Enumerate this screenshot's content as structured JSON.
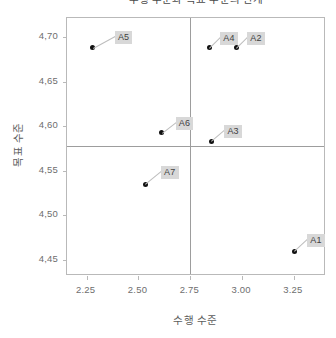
{
  "chart_data": {
    "type": "scatter",
    "title": "수행 수준과 목표 수준의 관계",
    "xlabel": "수행 수준",
    "ylabel": "목표 수준",
    "xlim": [
      2.155,
      3.405
    ],
    "ylim": [
      4.432,
      4.7215
    ],
    "xticks": [
      "2.25",
      "2.50",
      "2.75",
      "3.00",
      "3.25"
    ],
    "xtick_values": [
      2.25,
      2.5,
      2.75,
      3.0,
      3.25
    ],
    "yticks": [
      "4,70",
      "4,65",
      "4,60",
      "4,55",
      "4,50",
      "4,45"
    ],
    "ytick_values": [
      4.7,
      4.65,
      4.6,
      4.55,
      4.5,
      4.45
    ],
    "grid": false,
    "legend": "none",
    "reference_lines": {
      "vertical_x": 2.75,
      "horizontal_y": 4.578
    },
    "point_color": "#111111",
    "label_background": "#d8d8d8",
    "points": [
      {
        "label": "A5",
        "x": 2.28,
        "y": 4.688,
        "label_dx": 22,
        "label_dy": -17
      },
      {
        "label": "A4",
        "x": 2.842,
        "y": 4.688,
        "label_dx": 11,
        "label_dy": -16
      },
      {
        "label": "A2",
        "x": 2.972,
        "y": 4.688,
        "label_dx": 11,
        "label_dy": -16
      },
      {
        "label": "A6",
        "x": 2.612,
        "y": 4.593,
        "label_dx": 14,
        "label_dy": -16
      },
      {
        "label": "A3",
        "x": 2.852,
        "y": 4.583,
        "label_dx": 13,
        "label_dy": -16
      },
      {
        "label": "A7",
        "x": 2.532,
        "y": 4.535,
        "label_dx": 16,
        "label_dy": -18
      },
      {
        "label": "A1",
        "x": 3.252,
        "y": 4.46,
        "label_dx": 13,
        "label_dy": -17
      }
    ]
  }
}
